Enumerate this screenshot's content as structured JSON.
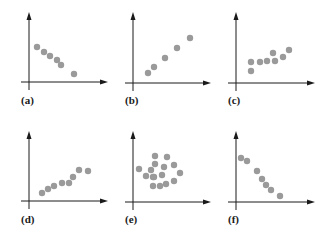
{
  "chart_data": [
    {
      "type": "scatter",
      "label": "(a)",
      "title": "",
      "xlabel": "",
      "ylabel": "",
      "grid": false,
      "description": "negative linear association",
      "origin_px": [
        29,
        82
      ],
      "axis_end_px": {
        "x": 108,
        "y": 12
      },
      "points_px": [
        [
          37,
          47
        ],
        [
          44,
          52
        ],
        [
          50,
          56
        ],
        [
          57,
          60
        ],
        [
          61,
          65
        ],
        [
          74,
          74
        ]
      ]
    },
    {
      "type": "scatter",
      "label": "(b)",
      "title": "",
      "xlabel": "",
      "ylabel": "",
      "grid": false,
      "description": "positive linear association",
      "origin_px": [
        133,
        83
      ],
      "axis_end_px": {
        "x": 211,
        "y": 12
      },
      "points_px": [
        [
          148,
          73
        ],
        [
          154,
          67
        ],
        [
          165,
          58
        ],
        [
          177,
          48
        ],
        [
          190,
          38
        ]
      ]
    },
    {
      "type": "scatter",
      "label": "(c)",
      "title": "",
      "xlabel": "",
      "ylabel": "",
      "grid": false,
      "description": "weak positive association",
      "origin_px": [
        236,
        83
      ],
      "axis_end_px": {
        "x": 315,
        "y": 12
      },
      "points_px": [
        [
          251,
          71
        ],
        [
          251,
          62
        ],
        [
          260,
          62
        ],
        [
          267,
          61
        ],
        [
          273,
          53
        ],
        [
          275,
          61
        ],
        [
          283,
          57
        ],
        [
          289,
          50
        ]
      ]
    },
    {
      "type": "scatter",
      "label": "(d)",
      "title": "",
      "xlabel": "",
      "ylabel": "",
      "grid": false,
      "description": "positive association, slightly curved",
      "origin_px": [
        29,
        201
      ],
      "axis_end_px": {
        "x": 108,
        "y": 131
      },
      "points_px": [
        [
          42,
          193
        ],
        [
          48,
          189
        ],
        [
          54,
          186
        ],
        [
          62,
          183
        ],
        [
          69,
          183
        ],
        [
          73,
          177
        ],
        [
          79,
          170
        ],
        [
          88,
          171
        ]
      ]
    },
    {
      "type": "scatter",
      "label": "(e)",
      "title": "",
      "xlabel": "",
      "ylabel": "",
      "grid": false,
      "description": "no association (cloud)",
      "origin_px": [
        133,
        202
      ],
      "axis_end_px": {
        "x": 211,
        "y": 131
      },
      "points_px": [
        [
          155,
          156
        ],
        [
          167,
          157
        ],
        [
          155,
          164
        ],
        [
          174,
          165
        ],
        [
          139,
          169
        ],
        [
          151,
          170
        ],
        [
          164,
          167
        ],
        [
          146,
          176
        ],
        [
          154,
          177
        ],
        [
          162,
          175
        ],
        [
          180,
          173
        ],
        [
          174,
          181
        ],
        [
          166,
          184
        ],
        [
          153,
          186
        ],
        [
          160,
          186
        ],
        [
          153,
          177
        ]
      ]
    },
    {
      "type": "scatter",
      "label": "(f)",
      "title": "",
      "xlabel": "",
      "ylabel": "",
      "grid": false,
      "description": "strong negative association",
      "origin_px": [
        236,
        202
      ],
      "axis_end_px": {
        "x": 315,
        "y": 131
      },
      "points_px": [
        [
          241,
          158
        ],
        [
          247,
          161
        ],
        [
          257,
          171
        ],
        [
          262,
          179
        ],
        [
          266,
          185
        ],
        [
          271,
          190
        ],
        [
          280,
          196
        ]
      ]
    }
  ],
  "style": {
    "axis_color": "#1a1a1a",
    "point_color": "#9a9a9a",
    "point_radius": 3.2,
    "background": "#ffffff"
  },
  "labels": {
    "a": "(a)",
    "b": "(b)",
    "c": "(c)",
    "d": "(d)",
    "e": "(e)",
    "f": "(f)"
  },
  "label_positions": {
    "a": [
      21,
      94
    ],
    "b": [
      125,
      94
    ],
    "c": [
      228,
      94
    ],
    "d": [
      21,
      213
    ],
    "e": [
      125,
      213
    ],
    "f": [
      228,
      213
    ]
  }
}
